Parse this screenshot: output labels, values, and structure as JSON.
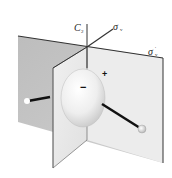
{
  "diagram": {
    "type": "symmetry-elements",
    "labels": {
      "c2_main": "C",
      "c2_sub": "2",
      "sigma_v_main": "σ",
      "sigma_v_sub": "v",
      "sigma_v_prime_main": "σ",
      "sigma_v_prime_sub": "v",
      "sigma_v_prime_mark": "′"
    },
    "lobe_signs": {
      "front": "−",
      "back": "+"
    },
    "colors": {
      "plane_back": "#b8b8b8",
      "plane_front": "#e4e4e4",
      "plane_edge": "#333333",
      "bond": "#111111",
      "orbital": "#f2f2f2"
    }
  }
}
